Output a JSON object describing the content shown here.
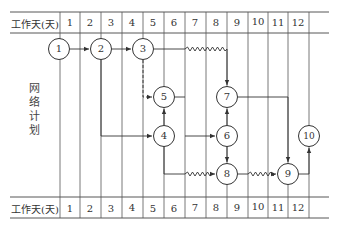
{
  "header_top": {
    "label": "工作天(天)",
    "days": [
      "1",
      "2",
      "3",
      "4",
      "5",
      "6",
      "7",
      "8",
      "9",
      "10",
      "11",
      "12"
    ]
  },
  "header_bottom": {
    "label": "工作天(天)",
    "days": [
      "1",
      "2",
      "3",
      "4",
      "5",
      "6",
      "7",
      "8",
      "9",
      "10",
      "11",
      "12"
    ]
  },
  "side_label": [
    "网",
    "络",
    "计",
    "划"
  ],
  "nodes": [
    {
      "id": "1",
      "x": 59,
      "y": 49
    },
    {
      "id": "2",
      "x": 101,
      "y": 49
    },
    {
      "id": "3",
      "x": 143,
      "y": 49
    },
    {
      "id": "5",
      "x": 164,
      "y": 97
    },
    {
      "id": "4",
      "x": 164,
      "y": 136
    },
    {
      "id": "7",
      "x": 227,
      "y": 97
    },
    {
      "id": "6",
      "x": 227,
      "y": 136
    },
    {
      "id": "8",
      "x": 227,
      "y": 174
    },
    {
      "id": "9",
      "x": 288,
      "y": 174
    },
    {
      "id": "10",
      "x": 309,
      "y": 136
    }
  ],
  "edges": [
    {
      "from": "1",
      "to": "2",
      "style": "solid"
    },
    {
      "from": "2",
      "to": "3",
      "style": "solid"
    },
    {
      "from": "3",
      "to": "7",
      "style": "wavy-then-solid"
    },
    {
      "from": "3",
      "to": "5",
      "style": "dashed"
    },
    {
      "from": "2",
      "to": "4",
      "style": "solid"
    },
    {
      "from": "4",
      "to": "5",
      "style": "solid"
    },
    {
      "from": "4",
      "to": "6",
      "style": "solid"
    },
    {
      "from": "6",
      "to": "7",
      "style": "solid"
    },
    {
      "from": "6",
      "to": "8",
      "style": "solid"
    },
    {
      "from": "4",
      "to": "8",
      "style": "wavy"
    },
    {
      "from": "7",
      "to": "9",
      "style": "solid"
    },
    {
      "from": "8",
      "to": "9",
      "style": "wavy"
    },
    {
      "from": "9",
      "to": "10",
      "style": "solid"
    }
  ],
  "colors": {
    "line": "#333333",
    "background": "#ffffff"
  }
}
